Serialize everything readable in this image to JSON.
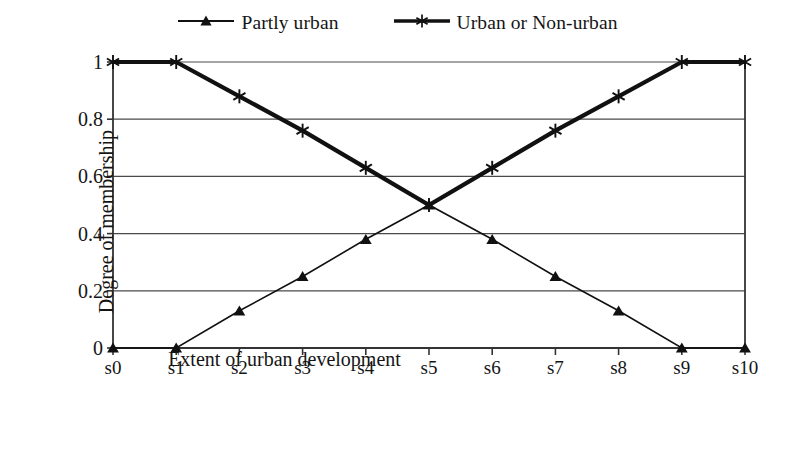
{
  "chart_data": {
    "type": "line",
    "title": "",
    "subtitle": "",
    "xlabel": "Extent of urban development",
    "ylabel": "Degree of membership",
    "categories": [
      "s0",
      "s1",
      "s2",
      "s3",
      "s4",
      "s5",
      "s6",
      "s7",
      "s8",
      "s9",
      "s10"
    ],
    "x_tick_labels": [
      "s0",
      "s1",
      "s2",
      "s3",
      "s4",
      "s5",
      "s6",
      "s7",
      "s8",
      "s9",
      "s10"
    ],
    "y_tick_labels": [
      "0",
      "0.2",
      "0.4",
      "0.6",
      "0.8",
      "1"
    ],
    "y_ticks": [
      0,
      0.2,
      0.4,
      0.6,
      0.8,
      1
    ],
    "ylim": [
      0,
      1
    ],
    "xlim": [
      0,
      10
    ],
    "grid": "horizontal",
    "legend_position": "top-center",
    "series": [
      {
        "name": "Partly urban",
        "marker": "triangle",
        "color": "#111111",
        "line_width": 1.6,
        "values": [
          0,
          0,
          0.13,
          0.25,
          0.38,
          0.5,
          0.38,
          0.25,
          0.13,
          0,
          0
        ]
      },
      {
        "name": "Urban or Non-urban",
        "marker": "asterisk",
        "color": "#111111",
        "line_width": 4.2,
        "values": [
          1,
          1,
          0.88,
          0.76,
          0.63,
          0.5,
          0.63,
          0.76,
          0.88,
          1,
          1
        ]
      }
    ]
  },
  "legend": {
    "entries": [
      {
        "label": "Partly urban",
        "marker": "triangle-marker-icon"
      },
      {
        "label": "Urban or Non-urban",
        "marker": "asterisk-marker-icon"
      }
    ]
  },
  "axes": {
    "y_title": "Degree of membership",
    "x_title": "Extent of urban development"
  },
  "colors": {
    "ink": "#111111",
    "grid": "#4a4a4a",
    "background": "#ffffff"
  }
}
